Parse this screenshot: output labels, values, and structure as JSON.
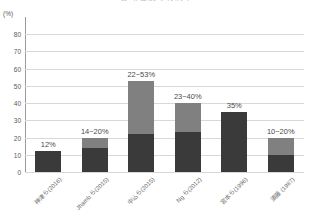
{
  "title": "診断名別の有病率",
  "axis": {
    "y_unit": "(%)",
    "y_ticks": [
      "80",
      "70",
      "60",
      "50",
      "40",
      "30",
      "20",
      "10",
      "0"
    ],
    "y_tick_values": [
      80,
      70,
      60,
      50,
      40,
      30,
      20,
      10,
      0
    ],
    "y_min": 0,
    "y_max": 90
  },
  "colors": {
    "segment_low": "#3a3a3a",
    "segment_high": "#808080",
    "gridline": "#d8d8d8",
    "axis": "#9a9a9a",
    "text": "#5a5a5a"
  },
  "chart_data": {
    "type": "bar",
    "title": "診断名別の有病率",
    "xlabel": "",
    "ylabel": "(%)",
    "ylim": [
      0,
      90
    ],
    "grid": true,
    "legend": "none",
    "stacked": true,
    "categories": [
      "神津ら(2016)",
      "Jhamb ら(2015)",
      "中込ら(2015)",
      "Ng ら(2012)",
      "宮本ら(1996)",
      "須藤 (1987)"
    ],
    "labels": [
      "12%",
      "14~20%",
      "22~53%",
      "23~40%",
      "35%",
      "10~20%"
    ],
    "series": [
      {
        "name": "下限値",
        "values": [
          12,
          14,
          22,
          23,
          35,
          10
        ]
      },
      {
        "name": "上限までの幅",
        "values": [
          0,
          6,
          31,
          17,
          0,
          10
        ]
      }
    ],
    "ranges": [
      {
        "category": "神津ら(2016)",
        "low": 12,
        "high": 12,
        "label": "12%"
      },
      {
        "category": "Jhamb ら(2015)",
        "low": 14,
        "high": 20,
        "label": "14~20%"
      },
      {
        "category": "中込ら(2015)",
        "low": 22,
        "high": 53,
        "label": "22~53%"
      },
      {
        "category": "Ng ら(2012)",
        "low": 23,
        "high": 40,
        "label": "23~40%"
      },
      {
        "category": "宮本ら(1996)",
        "low": 35,
        "high": 35,
        "label": "35%"
      },
      {
        "category": "須藤 (1987)",
        "low": 10,
        "high": 20,
        "label": "10~20%"
      }
    ]
  }
}
